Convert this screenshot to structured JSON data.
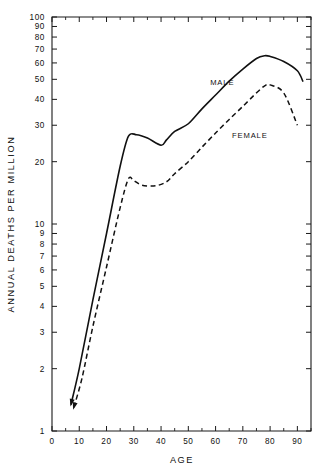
{
  "chart_data": {
    "type": "line",
    "title": "",
    "xlabel": "AGE",
    "ylabel": "ANNUAL DEATHS PER MILLION",
    "yscale": "log",
    "ylim": [
      1,
      100
    ],
    "xlim": [
      0,
      95
    ],
    "grid": false,
    "legend_position": "inline-annotations",
    "y_tick_labels": [
      "100",
      "90",
      "80",
      "70",
      "60",
      "50",
      "40",
      "30",
      "20",
      "10",
      "9",
      "8",
      "7",
      "6",
      "5",
      "4",
      "3",
      "2",
      "1"
    ],
    "y_tick_values": [
      100,
      90,
      80,
      70,
      60,
      50,
      40,
      30,
      20,
      10,
      9,
      8,
      7,
      6,
      5,
      4,
      3,
      2,
      1
    ],
    "x_tick_labels": [
      "0",
      "10",
      "20",
      "30",
      "40",
      "50",
      "60",
      "70",
      "80",
      "90"
    ],
    "x_tick_values": [
      0,
      10,
      20,
      30,
      40,
      50,
      60,
      70,
      80,
      90
    ],
    "x_minor_ticks": [
      5,
      15,
      25,
      35,
      45,
      55,
      65,
      75,
      85,
      95
    ],
    "series": [
      {
        "name": "MALE",
        "style": "solid",
        "label_x": 58,
        "label_y": 47,
        "start_arrow": true,
        "x": [
          7,
          10,
          15,
          20,
          25,
          28,
          31,
          35,
          40,
          42,
          45,
          50,
          55,
          60,
          65,
          70,
          75,
          78,
          80,
          85,
          90,
          92
        ],
        "y": [
          1.35,
          2.0,
          4.3,
          9.0,
          19.0,
          26.5,
          27.0,
          26.0,
          24.0,
          25.5,
          28.0,
          30.5,
          36.0,
          42.0,
          49.0,
          56.0,
          63.0,
          65.0,
          64.5,
          61.0,
          55.0,
          49.0
        ]
      },
      {
        "name": "FEMALE",
        "style": "dashed",
        "label_x": 66,
        "label_y": 26,
        "start_arrow": true,
        "x": [
          8,
          11,
          15,
          20,
          25,
          28,
          30,
          33,
          38,
          42,
          45,
          50,
          55,
          60,
          65,
          70,
          75,
          78,
          80,
          85,
          90
        ],
        "y": [
          1.3,
          1.8,
          3.2,
          6.2,
          12.0,
          16.5,
          16.2,
          15.4,
          15.3,
          16.0,
          17.5,
          20.0,
          23.5,
          27.5,
          32.0,
          37.0,
          43.0,
          46.5,
          47.0,
          43.0,
          30.0
        ]
      }
    ]
  }
}
